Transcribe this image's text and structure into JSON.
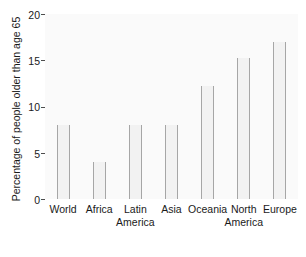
{
  "chart_data": {
    "type": "bar",
    "title": "",
    "xlabel": "",
    "ylabel": "Percentage of people older than age 65",
    "categories": [
      "World",
      "Africa",
      "Latin America",
      "Asia",
      "Oceania",
      "North America",
      "Europe"
    ],
    "category_lines": [
      [
        "World",
        ""
      ],
      [
        "Africa",
        ""
      ],
      [
        "Latin",
        "America"
      ],
      [
        "Asia",
        ""
      ],
      [
        "Oceania",
        ""
      ],
      [
        "North",
        "America"
      ],
      [
        "Europe",
        ""
      ]
    ],
    "values": [
      8,
      4,
      8,
      8,
      12.2,
      15.2,
      17
    ],
    "ylim": [
      0,
      20
    ],
    "yticks": [
      0,
      5,
      10,
      15,
      20
    ],
    "ytick_labels": [
      "0",
      "5",
      "10",
      "15",
      "20"
    ],
    "grid": false,
    "legend": null,
    "bar_fill_color": "#f2f2f2",
    "bar_edge_color": "#a6a6a6",
    "plot_background": "#fafafa",
    "text_color": "#1a1a1a"
  },
  "caption": {
    "text": ""
  }
}
